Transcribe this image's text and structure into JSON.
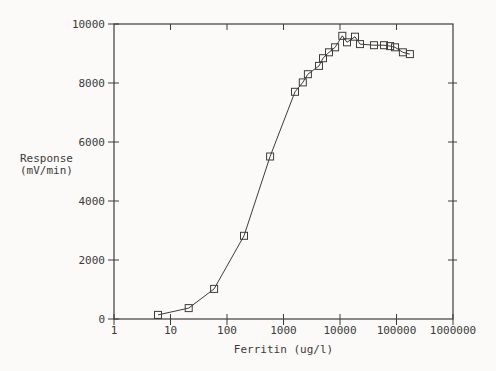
{
  "chart_data": {
    "type": "line",
    "title": "",
    "xlabel": "Ferritin (ug/l)",
    "ylabel": "Response\n(mV/min)",
    "x_scale": "log",
    "xlim": [
      1,
      1000000
    ],
    "ylim": [
      0,
      10000
    ],
    "x_ticks": [
      1,
      10,
      100,
      1000,
      10000,
      100000,
      1000000
    ],
    "x_tick_labels": [
      "1",
      "10",
      "100",
      "1000",
      "10000",
      "100000",
      "1000000"
    ],
    "y_ticks": [
      0,
      2000,
      4000,
      6000,
      8000,
      10000
    ],
    "y_tick_labels": [
      "0",
      "2000",
      "4000",
      "6000",
      "8000",
      "10000"
    ],
    "grid": false,
    "legend": "none",
    "marker": "open-square",
    "series": [
      {
        "name": "ferritin-dose-response",
        "points": [
          [
            6,
            140
          ],
          [
            21,
            370
          ],
          [
            59,
            1020
          ],
          [
            200,
            2820
          ],
          [
            580,
            5510
          ],
          [
            1600,
            7700
          ],
          [
            2200,
            8020
          ],
          [
            2700,
            8300
          ],
          [
            4250,
            8580
          ],
          [
            5000,
            8840
          ],
          [
            6400,
            9040
          ],
          [
            8200,
            9210
          ],
          [
            11000,
            9600
          ],
          [
            13300,
            9380
          ],
          [
            18400,
            9570
          ],
          [
            22600,
            9320
          ],
          [
            40000,
            9280
          ],
          [
            60000,
            9280
          ],
          [
            77000,
            9250
          ],
          [
            94000,
            9210
          ],
          [
            130000,
            9040
          ],
          [
            173000,
            8980
          ]
        ]
      }
    ],
    "colors": {
      "line": "#3c3c3c",
      "text": "#3a3a3a",
      "background": "#fbfaf8"
    }
  }
}
